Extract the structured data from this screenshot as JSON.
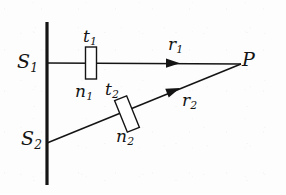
{
  "figure": {
    "type": "optics-ray-diagram",
    "background_color": "#fdfdfd",
    "stroke_color": "#141414",
    "labels": {
      "source_1": {
        "base": "S",
        "sub": "1"
      },
      "source_2": {
        "base": "S",
        "sub": "2"
      },
      "thickness_1": {
        "base": "t",
        "sub": "1"
      },
      "thickness_2": {
        "base": "t",
        "sub": "2"
      },
      "index_1": {
        "base": "n",
        "sub": "1"
      },
      "index_2": {
        "base": "n",
        "sub": "2"
      },
      "ray_1": {
        "base": "r",
        "sub": "1"
      },
      "ray_2": {
        "base": "r",
        "sub": "2"
      },
      "point_p": {
        "base": "P",
        "sub": ""
      }
    },
    "geometry": {
      "barrier": {
        "x": 47,
        "y_top": 22,
        "y_bottom": 185,
        "width": 3
      },
      "ray_1": {
        "x1": 47,
        "y1": 63,
        "x2": 240,
        "y2": 64,
        "arrow_x": 176,
        "arrow_y": 63
      },
      "ray_2": {
        "x1": 47,
        "y1": 143,
        "x2": 240,
        "y2": 64,
        "arrow_x": 180,
        "arrow_y": 88
      },
      "slab_1": {
        "cx": 91,
        "cy": 63,
        "w": 11,
        "h": 32,
        "rotation_deg": 0
      },
      "slab_2": {
        "cx": 127,
        "cy": 114,
        "w": 13,
        "h": 34,
        "rotation_deg": -22
      },
      "point_p": {
        "x": 240,
        "y": 64
      }
    }
  }
}
